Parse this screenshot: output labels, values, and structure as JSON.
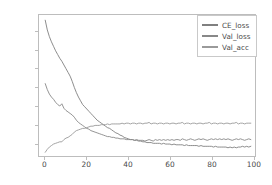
{
  "chart_data": {
    "type": "line",
    "title": "",
    "xlabel": "",
    "ylabel": "",
    "xlim": [
      -3,
      101
    ],
    "ylim": [
      0.33,
      2.22
    ],
    "grid": false,
    "legend_position": "upper right",
    "xticks": [
      0,
      20,
      40,
      60,
      80,
      100
    ],
    "xtick_labels": [
      "0",
      "20",
      "40",
      "60",
      "80",
      "100"
    ],
    "yticks": [
      0.5,
      0.75,
      1.0,
      1.25,
      1.5,
      1.75,
      2.0
    ],
    "ytick_labels": [
      "0.50",
      "0.75",
      "1.00",
      "1.25",
      "1.50",
      "1.75",
      "2.00"
    ],
    "x": [
      0,
      1,
      2,
      3,
      4,
      5,
      6,
      7,
      8,
      9,
      10,
      11,
      12,
      13,
      14,
      15,
      16,
      17,
      18,
      19,
      20,
      21,
      22,
      23,
      24,
      25,
      26,
      27,
      28,
      29,
      30,
      31,
      32,
      33,
      34,
      35,
      36,
      37,
      38,
      39,
      40,
      41,
      42,
      43,
      44,
      45,
      46,
      47,
      48,
      49,
      50,
      51,
      52,
      53,
      54,
      55,
      56,
      57,
      58,
      59,
      60,
      61,
      62,
      63,
      64,
      65,
      66,
      67,
      68,
      69,
      70,
      71,
      72,
      73,
      74,
      75,
      76,
      77,
      78,
      79,
      80,
      81,
      82,
      83,
      84,
      85,
      86,
      87,
      88,
      89,
      90,
      91,
      92,
      93,
      94,
      95,
      96,
      97,
      98,
      99
    ],
    "series": [
      {
        "name": "CE_loss",
        "color": "#808080",
        "values": [
          2.15,
          2.02,
          1.93,
          1.86,
          1.8,
          1.74,
          1.69,
          1.64,
          1.6,
          1.55,
          1.5,
          1.45,
          1.4,
          1.33,
          1.25,
          1.18,
          1.12,
          1.07,
          1.02,
          0.99,
          0.96,
          0.93,
          0.9,
          0.87,
          0.84,
          0.81,
          0.79,
          0.77,
          0.75,
          0.73,
          0.71,
          0.7,
          0.68,
          0.66,
          0.64,
          0.63,
          0.61,
          0.6,
          0.58,
          0.57,
          0.56,
          0.55,
          0.55,
          0.54,
          0.54,
          0.53,
          0.53,
          0.52,
          0.52,
          0.51,
          0.51,
          0.51,
          0.5,
          0.5,
          0.5,
          0.5,
          0.49,
          0.5,
          0.49,
          0.49,
          0.49,
          0.48,
          0.49,
          0.48,
          0.48,
          0.48,
          0.48,
          0.47,
          0.48,
          0.47,
          0.47,
          0.47,
          0.47,
          0.47,
          0.46,
          0.47,
          0.46,
          0.46,
          0.46,
          0.46,
          0.46,
          0.45,
          0.46,
          0.45,
          0.45,
          0.45,
          0.45,
          0.45,
          0.44,
          0.45,
          0.44,
          0.45,
          0.44,
          0.45,
          0.45,
          0.46,
          0.45,
          0.46,
          0.45,
          0.46
        ]
      },
      {
        "name": "Val_loss",
        "color": "#888888",
        "values": [
          1.3,
          1.22,
          1.16,
          1.12,
          1.09,
          1.05,
          1.02,
          1.0,
          1.03,
          0.97,
          0.94,
          0.92,
          0.9,
          0.88,
          0.85,
          0.81,
          0.78,
          0.76,
          0.74,
          0.72,
          0.7,
          0.69,
          0.67,
          0.66,
          0.65,
          0.64,
          0.63,
          0.62,
          0.61,
          0.6,
          0.59,
          0.59,
          0.58,
          0.58,
          0.57,
          0.57,
          0.56,
          0.56,
          0.56,
          0.55,
          0.55,
          0.55,
          0.55,
          0.54,
          0.55,
          0.54,
          0.54,
          0.54,
          0.53,
          0.54,
          0.55,
          0.54,
          0.53,
          0.55,
          0.54,
          0.55,
          0.54,
          0.55,
          0.54,
          0.55,
          0.54,
          0.55,
          0.54,
          0.55,
          0.55,
          0.54,
          0.56,
          0.55,
          0.54,
          0.55,
          0.56,
          0.55,
          0.54,
          0.55,
          0.56,
          0.55,
          0.56,
          0.55,
          0.54,
          0.55,
          0.56,
          0.55,
          0.56,
          0.55,
          0.56,
          0.55,
          0.56,
          0.55,
          0.56,
          0.55,
          0.54,
          0.55,
          0.56,
          0.55,
          0.56,
          0.55,
          0.54,
          0.55,
          0.56,
          0.55
        ]
      },
      {
        "name": "Val_acc",
        "color": "#9a9a9a",
        "values": [
          0.38,
          0.42,
          0.45,
          0.47,
          0.49,
          0.5,
          0.51,
          0.52,
          0.52,
          0.55,
          0.57,
          0.58,
          0.6,
          0.62,
          0.65,
          0.67,
          0.68,
          0.69,
          0.7,
          0.7,
          0.71,
          0.72,
          0.73,
          0.73,
          0.74,
          0.74,
          0.74,
          0.75,
          0.75,
          0.75,
          0.76,
          0.75,
          0.76,
          0.76,
          0.76,
          0.76,
          0.76,
          0.77,
          0.76,
          0.77,
          0.77,
          0.76,
          0.77,
          0.77,
          0.76,
          0.77,
          0.77,
          0.76,
          0.77,
          0.77,
          0.78,
          0.76,
          0.77,
          0.77,
          0.76,
          0.77,
          0.77,
          0.76,
          0.77,
          0.77,
          0.76,
          0.77,
          0.77,
          0.76,
          0.77,
          0.77,
          0.78,
          0.76,
          0.77,
          0.77,
          0.76,
          0.77,
          0.77,
          0.76,
          0.77,
          0.77,
          0.76,
          0.77,
          0.77,
          0.78,
          0.76,
          0.77,
          0.77,
          0.76,
          0.77,
          0.77,
          0.76,
          0.77,
          0.77,
          0.76,
          0.77,
          0.77,
          0.78,
          0.76,
          0.77,
          0.77,
          0.76,
          0.77,
          0.77,
          0.77
        ]
      }
    ]
  },
  "axes": {
    "frame_color": "#bdbdbd",
    "tick_color": "#4a4a4a"
  }
}
